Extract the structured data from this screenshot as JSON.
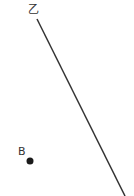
{
  "diagram": {
    "line": {
      "label": "乙",
      "x1": 37,
      "y1": 19,
      "x2": 125,
      "y2": 196,
      "color": "#333333"
    },
    "point": {
      "label": "B",
      "cx": 30,
      "cy": 161,
      "color": "#1a1a1a"
    }
  }
}
